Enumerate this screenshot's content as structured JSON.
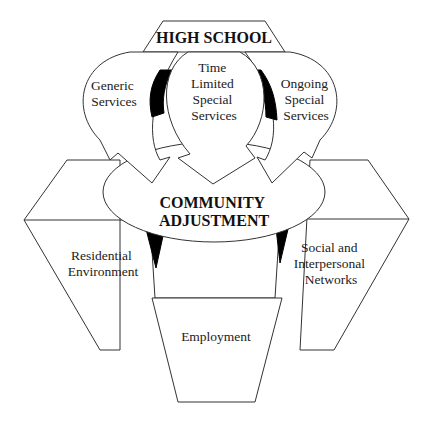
{
  "diagram": {
    "top": {
      "label": "HIGH SCHOOL"
    },
    "arrows": [
      {
        "lines": [
          "Generic",
          "Services"
        ]
      },
      {
        "lines": [
          "Time",
          "Limited",
          "Special",
          "Services"
        ]
      },
      {
        "lines": [
          "Ongoing",
          "Special",
          "Services"
        ]
      }
    ],
    "center": {
      "lines": [
        "COMMUNITY",
        "ADJUSTMENT"
      ]
    },
    "outcomes": [
      {
        "lines": [
          "Residential",
          "Environment"
        ]
      },
      {
        "lines": [
          "Social and",
          "Interpersonal",
          "Networks"
        ]
      },
      {
        "lines": [
          "Employment"
        ]
      }
    ],
    "colors": {
      "stroke": "#333333",
      "fill": "#ffffff",
      "accent": "#000000"
    }
  }
}
